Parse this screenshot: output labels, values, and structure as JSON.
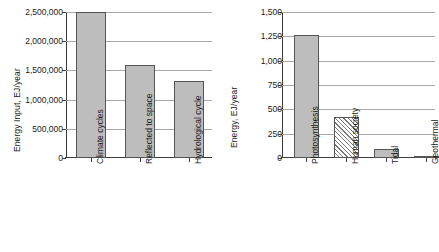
{
  "figure": {
    "background": "#ffffff",
    "bar_fill_solid": "#bdbdbd",
    "bar_edge": "#555555",
    "grid_color": "#a8a8a8",
    "axis_color": "#3c3c3c"
  },
  "chart_data": [
    {
      "id": "left",
      "type": "bar",
      "title": "",
      "xlabel": "",
      "ylabel": "Energy Input, EJ/year",
      "ylim": [
        0,
        2500000
      ],
      "grid": true,
      "legend": "none",
      "ytick_labels": [
        "0",
        "500,000",
        "1,000,000",
        "1,500,000",
        "2,000,000",
        "2,500,000"
      ],
      "ytick_values": [
        0,
        500000,
        1000000,
        1500000,
        2000000,
        2500000
      ],
      "categories": [
        "Climate cycles",
        "Reflected to space",
        "Hydrological cycle"
      ],
      "values": [
        2500000,
        1600000,
        1320000
      ],
      "fills": [
        "solid",
        "solid",
        "solid"
      ]
    },
    {
      "id": "right",
      "type": "bar",
      "title": "",
      "xlabel": "",
      "ylabel": "Energy, EJ/year",
      "ylim": [
        0,
        1500
      ],
      "grid": true,
      "legend": "none",
      "ytick_labels": [
        "0",
        "250",
        "500",
        "750",
        "1,000",
        "1,250",
        "1,500"
      ],
      "ytick_values": [
        0,
        250,
        500,
        750,
        1000,
        1250,
        1500
      ],
      "categories": [
        "Photosynthesis",
        "Human society",
        "Tidal",
        "Geothermal"
      ],
      "values": [
        1260,
        425,
        95,
        10
      ],
      "fills": [
        "solid",
        "hatch",
        "solid",
        "solid"
      ]
    }
  ]
}
